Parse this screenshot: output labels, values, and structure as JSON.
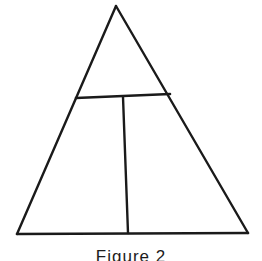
{
  "figure": {
    "caption": "Figure 2",
    "background_color": "#ffffff",
    "stroke_color": "#1a1a1a",
    "stroke_width": 2.2,
    "canvas": {
      "width": 262,
      "height": 261
    },
    "shapes": {
      "outer_triangle": {
        "name": "outer-triangle",
        "apex": {
          "x": 116,
          "y": 6
        },
        "bottom_left": {
          "x": 17,
          "y": 234
        },
        "bottom_right": {
          "x": 248,
          "y": 233
        }
      },
      "crossbar": {
        "name": "horizontal-crossbar",
        "left": {
          "x": 76,
          "y": 98
        },
        "right": {
          "x": 170,
          "y": 94
        }
      },
      "vertical_divider": {
        "name": "vertical-divider",
        "top": {
          "x": 123,
          "y": 97
        },
        "bottom": {
          "x": 128,
          "y": 233
        }
      }
    },
    "regions": [
      {
        "name": "upper-triangle",
        "label": ""
      },
      {
        "name": "lower-left-quadrilateral",
        "label": ""
      },
      {
        "name": "lower-right-quadrilateral",
        "label": ""
      }
    ]
  }
}
